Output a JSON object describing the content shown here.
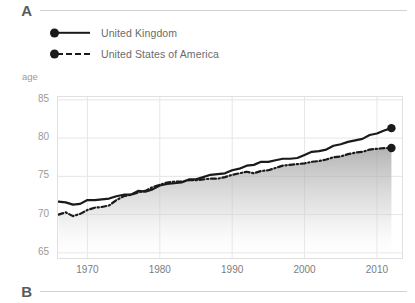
{
  "sections": {
    "a_label": "A",
    "b_label": "B"
  },
  "legend": {
    "position": "top-left",
    "items": [
      {
        "label": "United Kingdom",
        "style": "solid",
        "marker": "dot",
        "color": "#1a1a1a"
      },
      {
        "label": "United States of America",
        "style": "dash-dot",
        "marker": "dot",
        "color": "#1a1a1a"
      }
    ]
  },
  "axis_unit_label": "age",
  "chart_data": {
    "type": "line",
    "title": "",
    "subtitle": "",
    "xlabel": "",
    "ylabel": "age",
    "xlim": [
      1965.8,
      2013.6
    ],
    "ylim": [
      64.2,
      85.5
    ],
    "xticks": [
      1970,
      1980,
      1990,
      2000,
      2010
    ],
    "xtick_labels": [
      "1970",
      "1980",
      "1990",
      "2000",
      "2010"
    ],
    "yticks": [
      65,
      70,
      75,
      80,
      85
    ],
    "ytick_labels": [
      "65",
      "70",
      "75",
      "80",
      "85"
    ],
    "grid": true,
    "grid_color": "#e6e6e6",
    "area_fill": "gradient-grey",
    "endpoint_markers": true,
    "x": [
      1966,
      1967,
      1968,
      1969,
      1970,
      1971,
      1972,
      1973,
      1974,
      1975,
      1976,
      1977,
      1978,
      1979,
      1980,
      1981,
      1982,
      1983,
      1984,
      1985,
      1986,
      1987,
      1988,
      1989,
      1990,
      1991,
      1992,
      1993,
      1994,
      1995,
      1996,
      1997,
      1998,
      1999,
      2000,
      2001,
      2002,
      2003,
      2004,
      2005,
      2006,
      2007,
      2008,
      2009,
      2010,
      2011,
      2012
    ],
    "series": [
      {
        "name": "United Kingdom",
        "style": "solid",
        "color": "#1a1a1a",
        "values": [
          71.7,
          71.6,
          71.3,
          71.4,
          71.9,
          71.9,
          72.0,
          72.1,
          72.4,
          72.6,
          72.6,
          73.1,
          73.0,
          73.3,
          73.8,
          74.0,
          74.1,
          74.2,
          74.6,
          74.6,
          74.9,
          75.2,
          75.3,
          75.4,
          75.8,
          76.0,
          76.4,
          76.5,
          76.9,
          76.9,
          77.1,
          77.3,
          77.3,
          77.4,
          77.8,
          78.2,
          78.3,
          78.5,
          79.0,
          79.2,
          79.5,
          79.7,
          79.9,
          80.4,
          80.6,
          81.0,
          81.3
        ],
        "end_value": 81.3,
        "end_year": 2012
      },
      {
        "name": "United States of America",
        "style": "dash-dot",
        "color": "#1a1a1a",
        "values": [
          70.0,
          70.3,
          69.8,
          70.1,
          70.6,
          70.9,
          71.0,
          71.2,
          71.9,
          72.4,
          72.6,
          72.9,
          73.1,
          73.6,
          73.9,
          74.2,
          74.3,
          74.3,
          74.5,
          74.5,
          74.6,
          74.7,
          74.7,
          74.9,
          75.2,
          75.4,
          75.6,
          75.4,
          75.7,
          75.8,
          76.1,
          76.4,
          76.5,
          76.6,
          76.7,
          76.9,
          77.0,
          77.2,
          77.5,
          77.6,
          77.9,
          78.1,
          78.2,
          78.5,
          78.6,
          78.7,
          78.7
        ],
        "end_value": 78.7,
        "end_year": 2012
      }
    ]
  }
}
